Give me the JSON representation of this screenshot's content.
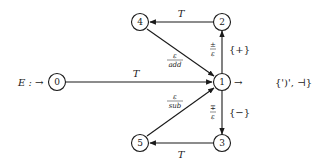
{
  "diagram": {
    "type": "finite-state-automaton",
    "title_prefix": "E : →",
    "colors": {
      "stroke": "#1a1a1a",
      "background": "#ffffff"
    },
    "nodes": [
      {
        "id": "0",
        "label": "0",
        "x": 57,
        "y": 82
      },
      {
        "id": "1",
        "label": "1",
        "x": 222,
        "y": 82
      },
      {
        "id": "2",
        "label": "2",
        "x": 222,
        "y": 22
      },
      {
        "id": "3",
        "label": "3",
        "x": 222,
        "y": 143
      },
      {
        "id": "4",
        "label": "4",
        "x": 140,
        "y": 22
      },
      {
        "id": "5",
        "label": "5",
        "x": 140,
        "y": 143
      }
    ],
    "edges": [
      {
        "from": "0",
        "to": "1",
        "label": "T"
      },
      {
        "from": "2",
        "to": "4",
        "label": "T"
      },
      {
        "from": "4",
        "to": "1",
        "label_num": "ε",
        "label_den": "add"
      },
      {
        "from": "1",
        "to": "2",
        "label_num": "±",
        "label_den": "ε",
        "side_label": "{+}"
      },
      {
        "from": "1",
        "to": "3",
        "label_num": "∓",
        "label_den": "ε",
        "side_label": "{−}"
      },
      {
        "from": "5",
        "to": "1",
        "label_num": "ε",
        "label_den": "sub"
      },
      {
        "from": "3",
        "to": "5",
        "label": "T"
      }
    ],
    "start": {
      "node": "0",
      "label": "E : →"
    },
    "final": {
      "node": "1",
      "arrow": "→",
      "label": "{')', ⊣}"
    }
  }
}
